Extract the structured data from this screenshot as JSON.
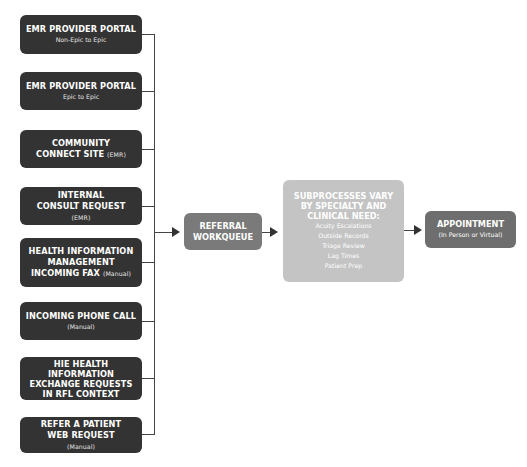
{
  "sources": [
    {
      "title": "EMR PROVIDER PORTAL",
      "title_suffix": "",
      "sub": "Non-Epic to Epic"
    },
    {
      "title": "EMR PROVIDER PORTAL",
      "title_suffix": "",
      "sub": "Epic to Epic"
    },
    {
      "title": "COMMUNITY CONNECT SITE",
      "title_suffix": "(EMR)",
      "sub": ""
    },
    {
      "title": "INTERNAL CONSULT REQUEST",
      "title_suffix": "(EMR)",
      "sub": ""
    },
    {
      "title": "HEALTH INFORMATION MANAGEMENT INCOMING FAX",
      "title_suffix": "(Manual)",
      "sub": ""
    },
    {
      "title": "INCOMING PHONE CALL",
      "title_suffix": "",
      "sub": "(Manual)"
    },
    {
      "title": "HIE HEALTH INFORMATION EXCHANGE REQUESTS IN RFL CONTEXT",
      "title_suffix": "",
      "sub": ""
    },
    {
      "title": "REFER A PATIENT WEB REQUEST",
      "title_suffix": "(Manual)",
      "sub": ""
    }
  ],
  "referral": {
    "title": "REFERRAL WORKQUEUE"
  },
  "subprocess": {
    "title": "SUBPROCESSES VARY BY SPECIALTY AND CLINICAL NEED:",
    "items": [
      "Acuity Escalations",
      "Outside Records",
      "Triage Review",
      "Lag Times",
      "Patient Prep"
    ]
  },
  "appointment": {
    "title": "APPOINTMENT",
    "sub": "(In Person or Virtual)"
  },
  "colors": {
    "source_box": "#333333",
    "referral_box": "#7a7a7a",
    "subprocess_box": "#c4c4c4",
    "appointment_box": "#6e6e6e",
    "connector": "#444444"
  }
}
